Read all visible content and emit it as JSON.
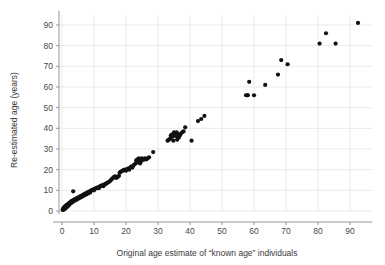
{
  "chart_data": {
    "type": "scatter",
    "title": "",
    "xlabel": "Original age estimate of “known age” individuals",
    "ylabel": "Re-estimated age (years)",
    "xlim": [
      -2,
      97
    ],
    "ylim": [
      -3,
      95
    ],
    "xticks": [
      0,
      10,
      20,
      30,
      40,
      50,
      60,
      70,
      80,
      90
    ],
    "yticks": [
      0,
      10,
      20,
      30,
      40,
      50,
      60,
      70,
      80,
      90
    ],
    "xtick_labels": [
      "0",
      "10",
      "20",
      "30",
      "40",
      "50",
      "60",
      "70",
      "80",
      "90"
    ],
    "ytick_labels": [
      "0",
      "10",
      "20",
      "30",
      "40",
      "50",
      "60",
      "70",
      "80",
      "90"
    ],
    "grid": true,
    "grid_color": "#e3e3e3",
    "legend": null,
    "marker": "circle",
    "marker_color": "#111111",
    "marker_size": 2.1,
    "x": [
      0.2,
      0.3,
      0.4,
      0.5,
      0.5,
      0.6,
      0.7,
      0.8,
      0.8,
      0.9,
      1.0,
      1.0,
      1.1,
      1.2,
      1.2,
      1.3,
      1.4,
      1.5,
      1.5,
      1.6,
      1.7,
      1.8,
      1.9,
      2.0,
      2.0,
      2.1,
      2.2,
      2.3,
      2.4,
      2.5,
      2.6,
      2.7,
      2.8,
      2.9,
      3.0,
      3.1,
      3.2,
      3.4,
      3.5,
      3.6,
      3.8,
      4.0,
      4.2,
      4.4,
      4.6,
      4.8,
      5.0,
      5.2,
      5.4,
      5.6,
      5.8,
      6.0,
      6.2,
      6.4,
      6.6,
      6.8,
      7.0,
      7.2,
      7.4,
      7.6,
      7.8,
      8.0,
      8.2,
      8.4,
      8.6,
      8.8,
      9.0,
      9.2,
      9.5,
      9.8,
      10.0,
      10.3,
      10.6,
      10.9,
      11.2,
      11.5,
      11.8,
      12.0,
      12.3,
      12.6,
      12.9,
      13.2,
      13.5,
      13.8,
      14.0,
      14.3,
      14.6,
      15.0,
      15.3,
      15.6,
      16.0,
      16.3,
      16.6,
      17.0,
      17.4,
      17.8,
      18.0,
      18.3,
      18.6,
      19.0,
      19.3,
      19.6,
      20.0,
      20.3,
      20.6,
      21.0,
      21.3,
      21.6,
      22.0,
      22.3,
      22.6,
      23.0,
      23.2,
      23.4,
      23.6,
      23.8,
      24.0,
      24.2,
      24.4,
      24.6,
      24.8,
      25.0,
      25.3,
      25.6,
      26.0,
      26.4,
      26.8,
      27.2,
      28.5,
      33.0,
      33.4,
      33.8,
      34.0,
      34.3,
      34.6,
      35.0,
      35.2,
      35.4,
      35.6,
      35.8,
      36.0,
      36.2,
      36.5,
      36.8,
      37.0,
      37.5,
      38.0,
      34.8,
      36.0,
      38.5,
      40.5,
      42.5,
      43.5,
      44.5,
      57.5,
      58.0,
      58.5,
      58.0,
      60.0,
      63.5,
      67.5,
      68.5,
      70.5,
      80.5,
      82.5,
      85.5,
      92.5
    ],
    "y": [
      0.5,
      0.8,
      1.0,
      0.6,
      1.5,
      1.2,
      1.8,
      1.0,
      2.0,
      1.5,
      1.2,
      2.2,
      1.8,
      1.5,
      2.5,
      2.0,
      2.8,
      2.2,
      1.8,
      3.0,
      2.5,
      3.2,
      2.8,
      3.5,
      2.5,
      3.0,
      3.8,
      3.2,
      4.0,
      3.5,
      4.2,
      3.8,
      4.5,
      4.0,
      4.8,
      4.2,
      5.0,
      4.5,
      9.5,
      5.2,
      5.5,
      5.0,
      5.8,
      6.0,
      5.5,
      6.2,
      6.5,
      6.0,
      6.8,
      7.0,
      6.5,
      7.2,
      7.5,
      7.0,
      7.8,
      8.0,
      7.5,
      8.2,
      8.5,
      8.0,
      8.8,
      9.0,
      8.5,
      9.2,
      9.5,
      9.0,
      9.8,
      10.0,
      10.2,
      10.5,
      10.0,
      10.8,
      11.0,
      11.2,
      11.5,
      11.0,
      11.8,
      12.0,
      12.2,
      12.5,
      12.0,
      12.8,
      13.0,
      13.2,
      13.5,
      13.8,
      14.0,
      14.5,
      15.0,
      15.5,
      16.0,
      16.5,
      16.8,
      16.0,
      16.5,
      17.0,
      18.5,
      19.0,
      19.2,
      19.5,
      19.8,
      20.0,
      19.5,
      20.2,
      20.5,
      20.0,
      21.0,
      21.5,
      21.0,
      22.0,
      22.5,
      23.0,
      24.5,
      23.5,
      25.0,
      24.0,
      25.5,
      24.5,
      23.0,
      25.0,
      24.2,
      25.5,
      25.0,
      24.8,
      25.5,
      25.0,
      25.5,
      26.0,
      28.5,
      34.0,
      34.5,
      35.0,
      36.5,
      37.0,
      36.0,
      38.0,
      37.5,
      36.5,
      37.0,
      38.0,
      36.0,
      37.5,
      35.5,
      36.5,
      37.0,
      38.0,
      38.5,
      34.0,
      34.5,
      40.5,
      34.0,
      43.5,
      44.5,
      46.0,
      56.0,
      56.0,
      62.5,
      56.0,
      56.0,
      61.0,
      66.0,
      73.0,
      71.0,
      81.0,
      86.0,
      81.0,
      91.0
    ]
  },
  "axes": {
    "x_axis_name": "x-axis",
    "y_axis_name": "y-axis"
  }
}
